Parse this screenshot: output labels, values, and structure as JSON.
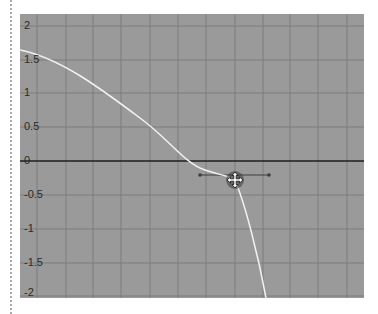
{
  "graph_editor": {
    "y_axis": {
      "ticks": [
        {
          "label": "2",
          "value": 2
        },
        {
          "label": "1.5",
          "value": 1.5
        },
        {
          "label": "1",
          "value": 1
        },
        {
          "label": "0.5",
          "value": 0.5
        },
        {
          "label": "0",
          "value": 0
        },
        {
          "label": "-0.5",
          "value": -0.5
        },
        {
          "label": "-1",
          "value": -1
        },
        {
          "label": "-1.5",
          "value": -1.5
        },
        {
          "label": "-2",
          "value": -2
        }
      ]
    },
    "colors": {
      "background": "#9a9a9a",
      "grid_line": "#7d7d7d",
      "zero_line": "#1e1e1e",
      "curve": "#f2f2f2",
      "tangent_handle": "#3c3c3c"
    },
    "curve": {
      "points_px": "M0,36 C40,44 80,74 120,104 C150,126 165,150 185,156 C200,161 210,162 215,166 C225,190 238,240 246,284",
      "keyframe": {
        "x_px": 215,
        "y_px": 166,
        "value_approx": -0.25
      }
    },
    "tangent_handle": {
      "x1_px": 180,
      "x2_px": 249,
      "y_px": 161
    },
    "cursor": {
      "icon": "move-cursor-icon"
    }
  }
}
